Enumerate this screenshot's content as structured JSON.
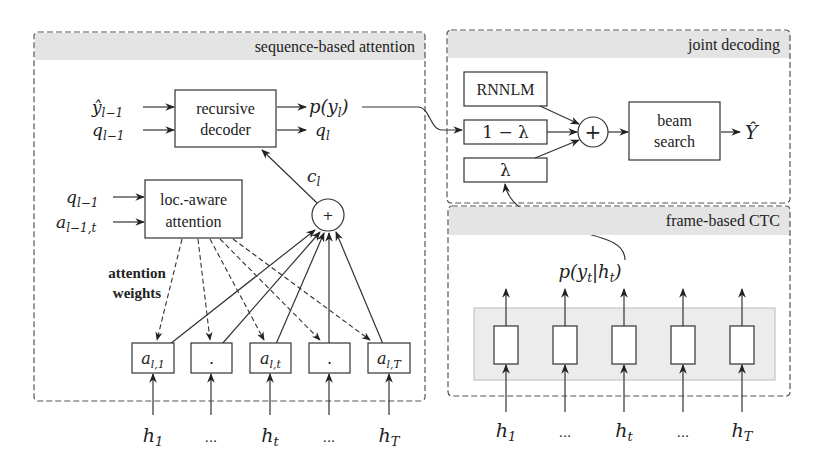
{
  "panels": {
    "attention": {
      "title": "sequence-based attention",
      "decoder": {
        "line1": "recursive",
        "line2": "decoder"
      },
      "decoder_inputs": [
        "ŷ",
        "q"
      ],
      "decoder_input_subs": [
        "l−1",
        "l−1"
      ],
      "decoder_outputs": {
        "py": "p(y",
        "py_sub": "l",
        "py_close": ")",
        "q": "q",
        "q_sub": "l"
      },
      "context": {
        "label": "c",
        "sub": "l"
      },
      "sum_symbol": "+",
      "attention_box": {
        "line1": "loc.-aware",
        "line2": "attention"
      },
      "attention_inputs": [
        "q",
        "a"
      ],
      "attention_input_subs": [
        "l−1",
        "l−1,t"
      ],
      "weights_label": {
        "line1": "attention",
        "line2": "weights"
      },
      "weight_cells": [
        {
          "main": "a",
          "sub": "l,1"
        },
        {
          "main": ".",
          "sub": ""
        },
        {
          "main": "a",
          "sub": "l,t"
        },
        {
          "main": ".",
          "sub": ""
        },
        {
          "main": "a",
          "sub": "l,T"
        }
      ],
      "encoder_inputs": [
        {
          "main": "h",
          "sub": "1"
        },
        {
          "main": "...",
          "sub": ""
        },
        {
          "main": "h",
          "sub": "t"
        },
        {
          "main": "...",
          "sub": ""
        },
        {
          "main": "h",
          "sub": "T"
        }
      ]
    },
    "joint": {
      "title": "joint decoding",
      "rnnlm": "RNNLM",
      "one_minus_lambda": "1 − λ",
      "lambda": "λ",
      "sum_symbol": "+",
      "beam": {
        "line1": "beam",
        "line2": "search"
      },
      "output": "Ŷ"
    },
    "ctc": {
      "title": "frame-based CTC",
      "output": {
        "pre": "p(y",
        "sub1": "t",
        "mid": "|h",
        "sub2": "t",
        "post": ")"
      },
      "cells": 5,
      "encoder_inputs": [
        {
          "main": "h",
          "sub": "1"
        },
        {
          "main": "...",
          "sub": ""
        },
        {
          "main": "h",
          "sub": "t"
        },
        {
          "main": "...",
          "sub": ""
        },
        {
          "main": "h",
          "sub": "T"
        }
      ]
    }
  },
  "colors": {
    "header_band": "#e4e4e4",
    "ctc_band": "#ececec",
    "stroke": "#333333"
  }
}
